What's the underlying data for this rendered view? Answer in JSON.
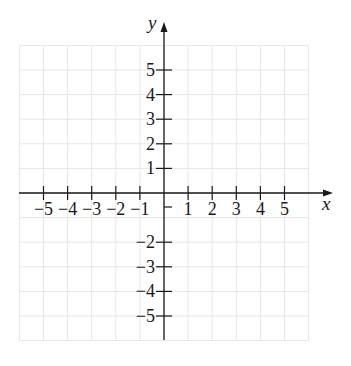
{
  "chart_data": {
    "type": "scatter",
    "title": "",
    "xlabel": "x",
    "ylabel": "y",
    "xlim": [
      -6,
      6
    ],
    "ylim": [
      -6,
      6
    ],
    "grid": true,
    "x_ticks": [
      -5,
      -4,
      -3,
      -2,
      -1,
      1,
      2,
      3,
      4,
      5
    ],
    "y_ticks": [
      5,
      4,
      3,
      2,
      1,
      -2,
      -3,
      -4,
      -5
    ],
    "x_tick_labels": [
      "−5",
      "−4",
      "−3",
      "−2",
      "−1",
      "1",
      "2",
      "3",
      "4",
      "5"
    ],
    "y_tick_labels": [
      "5",
      "4",
      "3",
      "2",
      "1",
      "−2",
      "−3",
      "−4",
      "−5"
    ],
    "series": [],
    "colors": {
      "axis": "#1a1a1a",
      "grid": "#e6e6e6",
      "background": "#ffffff"
    }
  }
}
